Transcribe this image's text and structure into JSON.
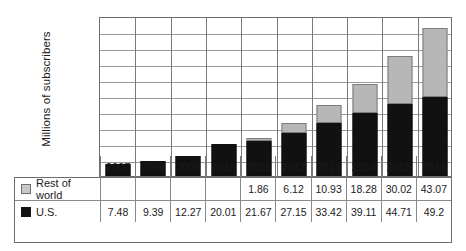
{
  "chart_data": {
    "type": "bar",
    "stacked": true,
    "title": "",
    "xlabel": "",
    "ylabel": "Millions of subscribers",
    "ylim": [
      0,
      100
    ],
    "ytick_step": 10,
    "yticks": [
      100,
      90,
      80,
      70,
      60,
      50,
      40,
      30,
      20,
      10,
      0
    ],
    "grid": true,
    "legend_position": "table-left",
    "categories": [
      "2007",
      "2008",
      "2009",
      "2010",
      "2011",
      "2012",
      "2013",
      "2014",
      "2015",
      "2016"
    ],
    "series": [
      {
        "name": "Rest of world",
        "color": "#b7b7b7",
        "values": [
          null,
          null,
          null,
          null,
          1.86,
          6.12,
          10.93,
          18.28,
          30.02,
          43.07
        ],
        "labels": [
          "",
          "",
          "",
          "",
          "1.86",
          "6.12",
          "10.93",
          "18.28",
          "30.02",
          "43.07"
        ]
      },
      {
        "name": "U.S.",
        "color": "#111111",
        "values": [
          7.48,
          9.39,
          12.27,
          20.01,
          21.67,
          27.15,
          33.42,
          39.11,
          44.71,
          49.2
        ],
        "labels": [
          "7.48",
          "9.39",
          "12.27",
          "20.01",
          "21.67",
          "27.15",
          "33.42",
          "39.11",
          "44.71",
          "49.2"
        ]
      }
    ]
  },
  "axis": {
    "y_title": "Millions of subscribers"
  },
  "table": {
    "header": [
      "2007",
      "2008",
      "2009",
      "2010",
      "2011",
      "2012",
      "2013",
      "2014",
      "2015",
      "2016"
    ],
    "rows": [
      {
        "label": "Rest of world",
        "swatch": "legend-swatch-rest-of-world",
        "values": [
          "",
          "",
          "",
          "",
          "1.86",
          "6.12",
          "10.93",
          "18.28",
          "30.02",
          "43.07"
        ]
      },
      {
        "label": "U.S.",
        "swatch": "legend-swatch-us",
        "values": [
          "7.48",
          "9.39",
          "12.27",
          "20.01",
          "21.67",
          "27.15",
          "33.42",
          "39.11",
          "44.71",
          "49.2"
        ]
      }
    ]
  },
  "colors": {
    "us": "#111111",
    "rest_of_world": "#b7b7b7",
    "grid": "#9a9a9a",
    "frame": "#6e6e6e",
    "text": "#1b1b1b"
  }
}
